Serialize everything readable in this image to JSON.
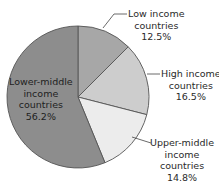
{
  "chart_data": {
    "type": "pie",
    "title": "",
    "start_angle_deg": -90,
    "direction": "clockwise",
    "slices": [
      {
        "label": "Low income countries",
        "value": 12.5,
        "color": "#a7a7a7",
        "display": [
          "Low income",
          "countries",
          "12.5%"
        ]
      },
      {
        "label": "High income countries",
        "value": 16.5,
        "color": "#cdcdcd",
        "display": [
          "High income",
          "countries",
          "16.5%"
        ]
      },
      {
        "label": "Upper-middle income countries",
        "value": 14.8,
        "color": "#ececec",
        "display": [
          "Upper-middle",
          "income",
          "countries",
          "14.8%"
        ]
      },
      {
        "label": "Lower-middle income countries",
        "value": 56.2,
        "color": "#8d8d8d",
        "display": [
          "Lower-middle",
          "income",
          "countries",
          "56.2%"
        ]
      }
    ],
    "categories": [
      "Low income countries",
      "High income countries",
      "Upper-middle income countries",
      "Lower-middle income countries"
    ],
    "values": [
      12.5,
      16.5,
      14.8,
      56.2
    ],
    "unit": "%"
  },
  "layout": {
    "center": [
      78,
      97
    ],
    "radius": 71,
    "stroke": "#555555"
  }
}
